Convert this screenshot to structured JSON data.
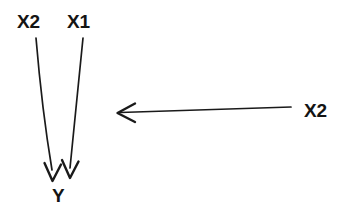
{
  "figure": {
    "type": "causal-path-diagram",
    "background_color": "#ffffff",
    "stroke_color": "#1a1a1a",
    "text_color": "#141414"
  },
  "nodes": [
    {
      "id": "x2-left",
      "label": "X2",
      "x": 31,
      "y": 21
    },
    {
      "id": "x1",
      "label": "X1",
      "x": 81,
      "y": 21
    },
    {
      "id": "y",
      "label": "Y",
      "x": 59,
      "y": 195
    },
    {
      "id": "x2-right",
      "label": "X2",
      "x": 320,
      "y": 110
    }
  ],
  "edges": [
    {
      "id": "edge-x2-left-to-y",
      "from": "x2-left",
      "to": "y",
      "direction": "down",
      "arrowhead": "open-chevron",
      "start": {
        "x": 36,
        "y": 38
      },
      "end": {
        "x": 52,
        "y": 180
      }
    },
    {
      "id": "edge-x1-to-y",
      "from": "x1",
      "to": "y",
      "direction": "down",
      "arrowhead": "open-chevron",
      "start": {
        "x": 83,
        "y": 38
      },
      "end": {
        "x": 70,
        "y": 177
      }
    },
    {
      "id": "edge-x2-right-leftward",
      "from": "x2-right",
      "to": "",
      "direction": "left",
      "arrowhead": "open-chevron",
      "start": {
        "x": 291,
        "y": 107
      },
      "end": {
        "x": 118,
        "y": 113
      }
    }
  ],
  "labels": {
    "x2_left": "X2",
    "x1": "X1",
    "y": "Y",
    "x2_right": "X2"
  }
}
